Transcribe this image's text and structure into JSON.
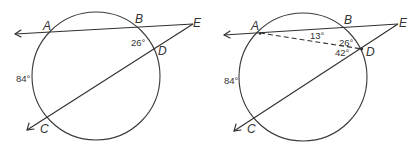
{
  "figures": [
    {
      "id": "left",
      "points": {
        "A": "A",
        "B": "B",
        "C": "C",
        "D": "D",
        "E": "E"
      },
      "angles": {
        "angle_E": "26°",
        "arc_AC": "84°"
      }
    },
    {
      "id": "right",
      "points": {
        "A": "A",
        "B": "B",
        "C": "C",
        "D": "D",
        "E": "E"
      },
      "angles": {
        "angle_BAD": "13°",
        "angle_E": "26°",
        "angle_ADC_ext": "42°",
        "arc_AC": "84°"
      }
    }
  ],
  "colors": {
    "stroke": "#2f2f2f",
    "text": "#333333",
    "background": "#ffffff"
  }
}
